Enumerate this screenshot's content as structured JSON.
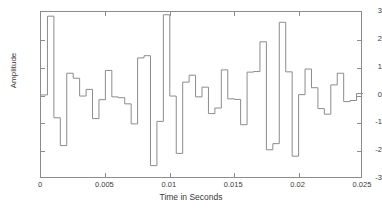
{
  "chart_data": {
    "type": "line",
    "subtype": "staircase",
    "title": "",
    "xlabel": "Time in Seconds",
    "ylabel": "Amplitude",
    "xlim": [
      0,
      0.025
    ],
    "ylim": [
      -3,
      3
    ],
    "xticks": [
      0,
      0.005,
      0.01,
      0.015,
      0.02,
      0.025
    ],
    "xticklabels": [
      "0",
      "0.005",
      "0.01",
      "0.015",
      "0.02",
      "0.025"
    ],
    "yticks": [
      -3,
      -2,
      -1,
      0,
      1,
      2,
      3
    ],
    "yticklabels": [
      "-3",
      "-2",
      "-1",
      "0",
      "1",
      "2",
      "3"
    ],
    "grid": false,
    "legend": null,
    "line_color": "#8c8c8c",
    "line_width": 1,
    "background": "#ffffff",
    "sample_interval": 0.0005,
    "n_samples": 50,
    "x": [
      0.0,
      0.0005,
      0.001,
      0.0015,
      0.002,
      0.0025,
      0.003,
      0.0035,
      0.004,
      0.0045,
      0.005,
      0.0055,
      0.006,
      0.0065,
      0.007,
      0.0075,
      0.008,
      0.0085,
      0.009,
      0.0095,
      0.01,
      0.0105,
      0.011,
      0.0115,
      0.012,
      0.0125,
      0.013,
      0.0135,
      0.014,
      0.0145,
      0.015,
      0.0155,
      0.016,
      0.0165,
      0.017,
      0.0175,
      0.018,
      0.0185,
      0.019,
      0.0195,
      0.02,
      0.0205,
      0.021,
      0.0215,
      0.022,
      0.0225,
      0.023,
      0.0235,
      0.024,
      0.0245
    ],
    "values": [
      0.02,
      2.85,
      -0.8,
      -1.8,
      0.8,
      0.62,
      -0.02,
      0.22,
      -0.83,
      -0.15,
      0.9,
      -0.05,
      -0.08,
      -0.3,
      -1.02,
      1.35,
      1.43,
      -2.52,
      -0.93,
      2.9,
      -0.02,
      -2.08,
      0.48,
      0.73,
      -0.05,
      0.3,
      -0.65,
      -0.45,
      0.92,
      -0.12,
      -0.14,
      -1.05,
      0.84,
      0.86,
      1.93,
      -1.95,
      -1.73,
      2.63,
      0.85,
      -2.18,
      0.03,
      0.95,
      0.28,
      -0.47,
      -0.67,
      0.38,
      0.8,
      -0.22,
      -0.18,
      0.07
    ],
    "series": [
      {
        "name": "signal",
        "values": [
          0.02,
          2.85,
          -0.8,
          -1.8,
          0.8,
          0.62,
          -0.02,
          0.22,
          -0.83,
          -0.15,
          0.9,
          -0.05,
          -0.08,
          -0.3,
          -1.02,
          1.35,
          1.43,
          -2.52,
          -0.93,
          2.9,
          -0.02,
          -2.08,
          0.48,
          0.73,
          -0.05,
          0.3,
          -0.65,
          -0.45,
          0.92,
          -0.12,
          -0.14,
          -1.05,
          0.84,
          0.86,
          1.93,
          -1.95,
          -1.73,
          2.63,
          0.85,
          -2.18,
          0.03,
          0.95,
          0.28,
          -0.47,
          -0.67,
          0.38,
          0.8,
          -0.22,
          -0.18,
          0.07
        ]
      }
    ]
  }
}
